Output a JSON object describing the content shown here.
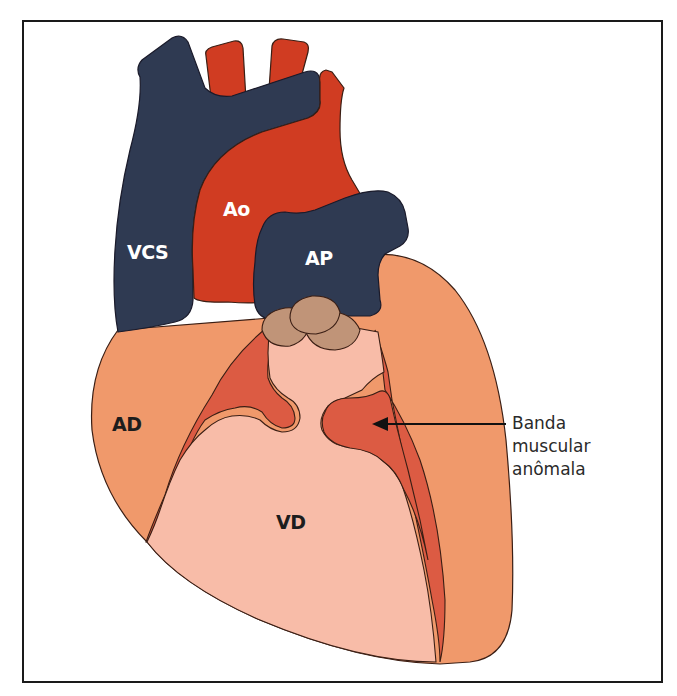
{
  "figure": {
    "type": "anatomical-diagram",
    "labels": {
      "vcs": "VCS",
      "ao": "Ao",
      "ap": "AP",
      "ad": "AD",
      "vd": "VD"
    },
    "callout": {
      "line1": "Banda",
      "line2": "muscular",
      "line3": "anômala",
      "target": "anomalous-muscle-band"
    },
    "colors": {
      "vein_navy": "#2f3a52",
      "aorta_red": "#d03c22",
      "atrium_orange": "#f0996b",
      "ventricle_pink": "#f8bca8",
      "muscle_red": "#dc5b43",
      "valve_brown": "#c09478",
      "outline": "#3a1e14",
      "frame": "#1a1a1a"
    }
  }
}
